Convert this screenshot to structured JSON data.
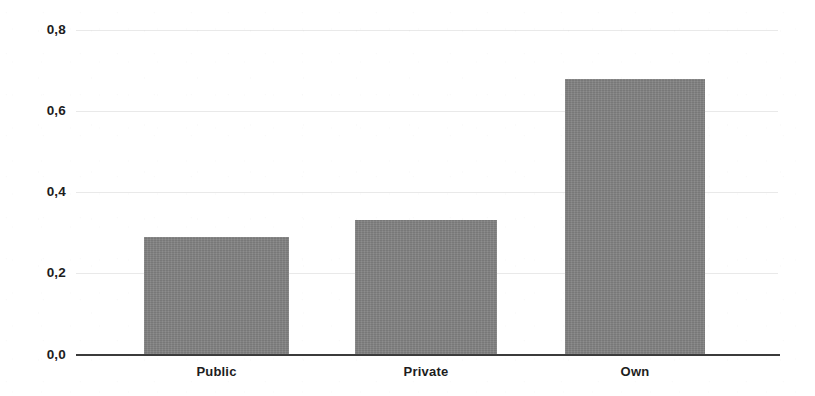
{
  "chart_data": {
    "type": "bar",
    "title": "",
    "subtitle": "",
    "xlabel": "",
    "ylabel": "",
    "categories": [
      "Public",
      "Private",
      "Own"
    ],
    "values": [
      0.29,
      0.33,
      0.68
    ],
    "ylim": [
      0.0,
      0.8
    ],
    "ytick_labels": [
      "0,0",
      "0,2",
      "0,4",
      "0,6",
      "0,8"
    ],
    "ytick_values": [
      0.0,
      0.2,
      0.4,
      0.6,
      0.8
    ],
    "grid": true,
    "legend": null,
    "legend_position": "none",
    "series": [
      {
        "name": "",
        "values": [
          0.29,
          0.33,
          0.68
        ]
      }
    ],
    "annotations": []
  },
  "style": {
    "bar_color": "#828282",
    "axis_color": "#3b3b3b",
    "grid_color": "#e9e9e9",
    "text_color": "#1d1d1d",
    "background": "#ffffff"
  },
  "axis": {
    "y": {
      "ticks": [
        {
          "label": "0,8",
          "value": 0.8
        },
        {
          "label": "0,6",
          "value": 0.6
        },
        {
          "label": "0,4",
          "value": 0.4
        },
        {
          "label": "0,2",
          "value": 0.2
        },
        {
          "label": "0,0",
          "value": 0.0
        }
      ]
    },
    "x": {
      "ticks": [
        {
          "label": "Public"
        },
        {
          "label": "Private"
        },
        {
          "label": "Own"
        }
      ]
    }
  }
}
